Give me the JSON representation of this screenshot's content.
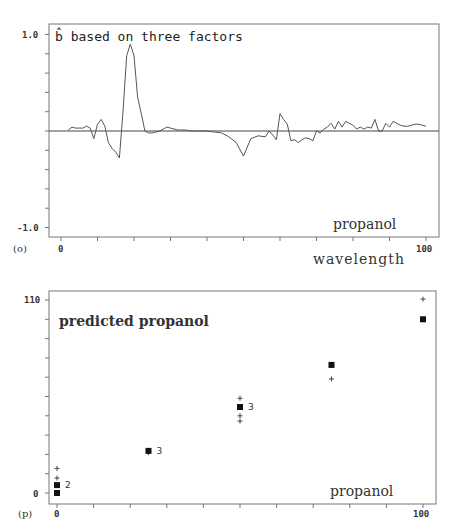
{
  "chart_data": [
    {
      "panel_label": "(o)",
      "type": "line",
      "title": "b̂ based on three factors",
      "annotation": "propanol",
      "xlabel": "wavelength",
      "ylabel": "",
      "xlim": [
        0,
        100
      ],
      "ylim": [
        -1.0,
        1.0
      ],
      "x_ticks": [
        "0",
        "100"
      ],
      "y_ticks": [
        "1.0",
        "-1.0"
      ],
      "grid": false,
      "zero_line": true,
      "series": [
        {
          "name": "b-hat",
          "x": [
            2,
            3,
            4,
            5,
            6,
            7,
            8,
            9,
            10,
            11,
            12,
            13,
            14,
            15,
            16,
            17,
            18,
            19,
            20,
            21,
            22,
            23,
            24,
            25,
            26,
            27,
            28,
            29,
            30,
            32,
            34,
            36,
            38,
            40,
            42,
            44,
            46,
            48,
            50,
            52,
            54,
            56,
            57,
            58,
            59,
            60,
            61,
            62,
            63,
            64,
            65,
            66,
            67,
            68,
            69,
            70,
            71,
            72,
            73,
            74,
            75,
            76,
            77,
            78,
            79,
            80,
            81,
            82,
            83,
            84,
            85,
            86,
            87,
            88,
            89,
            90,
            91,
            92,
            93,
            94,
            95,
            96,
            97,
            98,
            99,
            100
          ],
          "values": [
            0.01,
            0.04,
            0.03,
            0.03,
            0.03,
            0.05,
            0.03,
            -0.08,
            0.07,
            0.12,
            0.05,
            -0.12,
            -0.18,
            -0.22,
            -0.28,
            0.2,
            0.78,
            0.9,
            0.78,
            0.35,
            0.18,
            0.0,
            -0.02,
            -0.02,
            -0.01,
            0.0,
            0.02,
            0.04,
            0.03,
            0.01,
            0.01,
            0.0,
            0.0,
            0.0,
            -0.01,
            -0.02,
            -0.06,
            -0.12,
            -0.26,
            -0.08,
            -0.05,
            -0.06,
            0.0,
            -0.04,
            -0.09,
            0.18,
            0.12,
            0.07,
            -0.1,
            -0.09,
            -0.12,
            -0.09,
            -0.07,
            -0.08,
            -0.1,
            0.0,
            -0.02,
            0.02,
            0.04,
            0.08,
            0.02,
            0.1,
            0.04,
            0.1,
            0.08,
            0.06,
            0.02,
            0.04,
            0.02,
            0.04,
            0.03,
            0.12,
            0.0,
            0.0,
            0.08,
            0.04,
            0.1,
            0.08,
            0.06,
            0.05,
            0.05,
            0.06,
            0.07,
            0.07,
            0.06,
            0.05
          ]
        }
      ]
    },
    {
      "panel_label": "(p)",
      "type": "scatter",
      "title": "predicted propanol",
      "annotation": "propanol",
      "xlabel": "",
      "ylabel": "",
      "xlim": [
        0,
        100
      ],
      "ylim": [
        0,
        110
      ],
      "x_ticks": [
        "0",
        "100"
      ],
      "y_ticks": [
        "110",
        "0"
      ],
      "grid": false,
      "series": [
        {
          "name": "filled squares",
          "marker": "square",
          "points": [
            {
              "x": 0,
              "y": 0
            },
            {
              "x": 0,
              "y": 4.5,
              "count_label": "2"
            },
            {
              "x": 25,
              "y": 24,
              "count_label": "3"
            },
            {
              "x": 50,
              "y": 49,
              "count_label": "3"
            },
            {
              "x": 75,
              "y": 73
            },
            {
              "x": 100,
              "y": 99
            }
          ]
        },
        {
          "name": "plus signs",
          "marker": "plus",
          "points": [
            {
              "x": 0,
              "y": 14
            },
            {
              "x": 0,
              "y": 8.5
            },
            {
              "x": 25,
              "y": 23
            },
            {
              "x": 50,
              "y": 54
            },
            {
              "x": 50,
              "y": 44
            },
            {
              "x": 50,
              "y": 41
            },
            {
              "x": 75,
              "y": 65
            },
            {
              "x": 100,
              "y": 110.5
            }
          ]
        }
      ]
    }
  ]
}
